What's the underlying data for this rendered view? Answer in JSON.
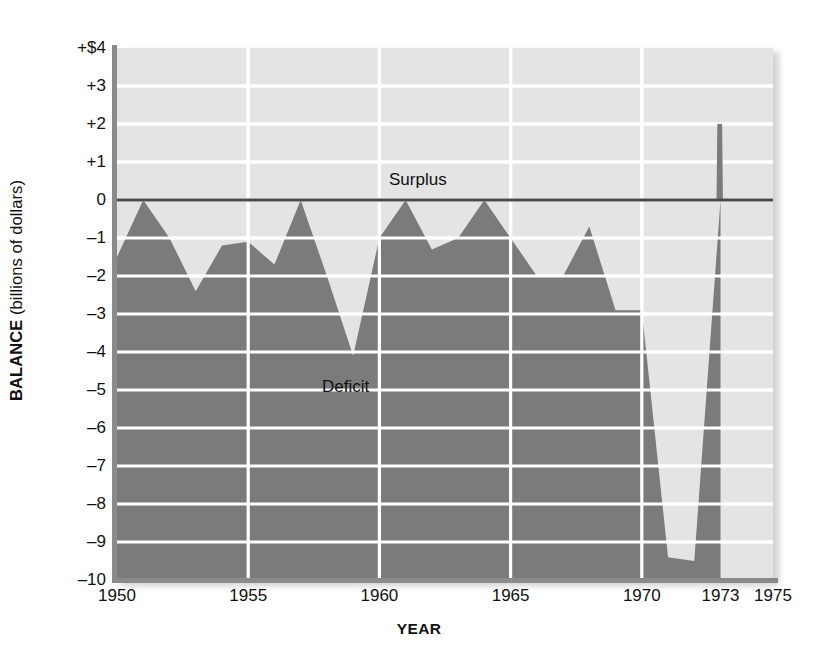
{
  "figure": {
    "background_color": "#ffffff",
    "plot_background_color": "#e4e4e4",
    "area_fill_color": "#7b7b7b",
    "gridline_color": "#ffffff",
    "axis_color": "#8a8a8a",
    "zero_line_color": "#4a4a4a"
  },
  "axes": {
    "y_title_bold": "BALANCE",
    "y_title_rest": " (billions of dollars)",
    "x_title": "YEAR",
    "y_ticks": [
      "+$4",
      "+3",
      "+2",
      "+1",
      "0",
      "–1",
      "–2",
      "–3",
      "–4",
      "–5",
      "–6",
      "–7",
      "–8",
      "–9",
      "–10"
    ],
    "y_tick_values": [
      4,
      3,
      2,
      1,
      0,
      -1,
      -2,
      -3,
      -4,
      -5,
      -6,
      -7,
      -8,
      -9,
      -10
    ],
    "x_ticks": [
      "1950",
      "1955",
      "1960",
      "1965",
      "1970",
      "1973",
      "1975"
    ],
    "x_tick_values": [
      1950,
      1955,
      1960,
      1965,
      1970,
      1973,
      1975
    ]
  },
  "annotations": {
    "surplus_label": "Surplus",
    "deficit_label": "Deficit"
  },
  "chart_data": {
    "type": "area",
    "title": "",
    "subtitle": "",
    "xlabel": "YEAR",
    "ylabel": "BALANCE (billions of dollars)",
    "xlim": [
      1950,
      1975
    ],
    "ylim": [
      -10,
      4
    ],
    "grid": true,
    "legend": "none",
    "annotations": [
      "Surplus",
      "Deficit"
    ],
    "x": [
      1950,
      1951,
      1952,
      1953,
      1954,
      1955,
      1956,
      1957,
      1958,
      1959,
      1960,
      1961,
      1962,
      1963,
      1964,
      1965,
      1966,
      1967,
      1968,
      1969,
      1970,
      1971,
      1972,
      1973
    ],
    "values": [
      -1.5,
      0.0,
      -1.0,
      -2.4,
      -1.2,
      -1.1,
      -1.7,
      0.0,
      -2.0,
      -4.1,
      -1.0,
      0.0,
      -1.3,
      -1.0,
      0.0,
      -1.0,
      -2.0,
      -2.0,
      -0.7,
      -2.9,
      -2.9,
      -9.4,
      -9.5,
      2.0
    ],
    "series": [
      {
        "name": "Federal budget balance",
        "values": [
          -1.5,
          0.0,
          -1.0,
          -2.4,
          -1.2,
          -1.1,
          -1.7,
          0.0,
          -2.0,
          -4.1,
          -1.0,
          0.0,
          -1.3,
          -1.0,
          0.0,
          -1.0,
          -2.0,
          -2.0,
          -0.7,
          -2.9,
          -2.9,
          -9.4,
          -9.5,
          2.0
        ]
      }
    ],
    "baseline": 0,
    "y_tick_step": 1,
    "x_tick_step": 5
  }
}
